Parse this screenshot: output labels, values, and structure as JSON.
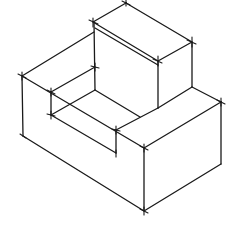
{
  "diagram": {
    "type": "isometric-sketch",
    "stroke_color": "#1a1a1a",
    "background": "#ffffff",
    "vertices": {
      "raised_top_back": [
        126,
        3
      ],
      "raised_top_left": [
        93,
        22
      ],
      "raised_top_right": [
        192,
        42
      ],
      "raised_top_front": [
        158,
        61
      ],
      "raised_base_left": [
        95,
        90
      ],
      "raised_base_front": [
        158,
        108
      ],
      "raised_base_right": [
        192,
        87
      ],
      "raised_left_inner": [
        94,
        31
      ],
      "left_wall_top": [
        22,
        76
      ],
      "left_wall_bottom": [
        22,
        136
      ],
      "step_top_left": [
        51,
        92
      ],
      "step_bottom_left": [
        51,
        115
      ],
      "step_top_back": [
        95,
        67
      ],
      "step_front_right": [
        116,
        130
      ],
      "step_front_right_low": [
        116,
        153
      ],
      "step_mid": [
        140,
        117
      ],
      "front_corner_top": [
        144,
        148
      ],
      "front_corner_bottom": [
        144,
        211
      ],
      "right_corner_top": [
        221,
        102
      ],
      "right_corner_bottom": [
        221,
        164
      ]
    },
    "edges": [
      [
        "raised_top_back",
        "raised_top_left"
      ],
      [
        "raised_top_back",
        "raised_top_right"
      ],
      [
        "raised_top_left",
        "raised_top_front"
      ],
      [
        "raised_top_right",
        "raised_top_front"
      ],
      [
        "raised_top_left",
        "raised_base_left"
      ],
      [
        "raised_top_front",
        "raised_base_front"
      ],
      [
        "raised_top_right",
        "raised_base_right"
      ],
      [
        "raised_left_inner",
        "left_wall_top"
      ],
      [
        "left_wall_top",
        "left_wall_bottom"
      ],
      [
        "left_wall_top",
        "front_corner_top"
      ],
      [
        "left_wall_bottom",
        "front_corner_bottom"
      ],
      [
        "front_corner_top",
        "front_corner_bottom"
      ],
      [
        "front_corner_top",
        "right_corner_top"
      ],
      [
        "front_corner_bottom",
        "right_corner_bottom"
      ],
      [
        "right_corner_top",
        "right_corner_bottom"
      ],
      [
        "raised_base_right",
        "right_corner_top"
      ],
      [
        "step_top_left",
        "step_top_back"
      ],
      [
        "step_top_left",
        "step_bottom_left"
      ],
      [
        "step_bottom_left",
        "raised_base_left"
      ],
      [
        "step_bottom_left",
        "step_front_right_low"
      ],
      [
        "step_front_right",
        "step_front_right_low"
      ],
      [
        "raised_base_left",
        "step_mid"
      ],
      [
        "step_mid",
        "raised_base_front"
      ],
      [
        "step_top_back",
        "raised_base_left"
      ]
    ],
    "double_line": [
      [
        94,
        27
      ],
      [
        158,
        64
      ]
    ]
  }
}
